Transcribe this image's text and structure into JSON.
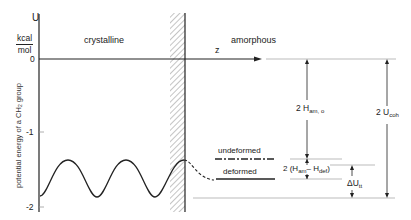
{
  "axis": {
    "y_symbol": "U",
    "y_unit_num": "kcal",
    "y_unit_den": "mol",
    "y_label_pre": "potential energy of a CH",
    "y_label_sub": "2",
    "y_label_post": " group",
    "y_ticks": [
      "0",
      "-1",
      "-2"
    ],
    "x_symbol": "z"
  },
  "regions": {
    "left": "crystalline",
    "right": "amorphous"
  },
  "levels": {
    "undeformed": "undeformed",
    "deformed": "deformed"
  },
  "annotations": {
    "h_am0_main": "2 H",
    "h_am0_sub": "am, o",
    "u_coh_main": "2 U",
    "u_coh_sub": "coh",
    "diff_pre": "2 (H",
    "diff_sub1": "am",
    "diff_mid": "– H",
    "diff_sub2": "def",
    "diff_post": ")",
    "du_main": "ΔU",
    "du_sub": "tt"
  },
  "colors": {
    "ink": "#222222",
    "hatch": "#888888",
    "thin": "#999999"
  }
}
